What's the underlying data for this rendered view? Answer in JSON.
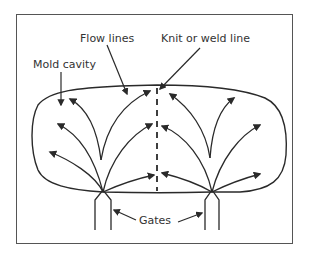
{
  "diagram": {
    "type": "injection-molding-flow",
    "labels": {
      "mold_cavity": "Mold cavity",
      "flow_lines": "Flow lines",
      "weld_line": "Knit or weld line",
      "gates": "Gates"
    },
    "colors": {
      "stroke": "#2a2a2a",
      "frame": "#555555",
      "text": "#333333",
      "background": "#ffffff"
    },
    "gates": [
      {
        "name": "left-gate",
        "apex": [
          103,
          192
        ],
        "legs_x": [
          95,
          111
        ]
      },
      {
        "name": "right-gate",
        "apex": [
          212,
          192
        ],
        "legs_x": [
          205,
          219
        ]
      }
    ],
    "weld_line_x": 157
  }
}
